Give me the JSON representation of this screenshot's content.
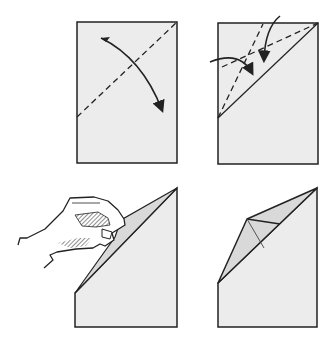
{
  "diagram": {
    "type": "origami-folding-steps",
    "colors": {
      "paper": "#ececec",
      "paper_shade": "#d9d9d9",
      "line": "#222222",
      "background": "#ffffff"
    },
    "steps": [
      {
        "index": 1,
        "description": "Fold corner along diagonal dashed line",
        "icons": [
          "valley-fold-line",
          "fold-arrow"
        ]
      },
      {
        "index": 2,
        "description": "Fold both edges of the flap to the center dashed lines",
        "icons": [
          "valley-fold-line",
          "fold-arrow",
          "fold-arrow"
        ]
      },
      {
        "index": 3,
        "description": "Hand pinching and folding the flap",
        "icons": [
          "hand"
        ]
      },
      {
        "index": 4,
        "description": "Resulting folded shape",
        "icons": []
      }
    ]
  }
}
